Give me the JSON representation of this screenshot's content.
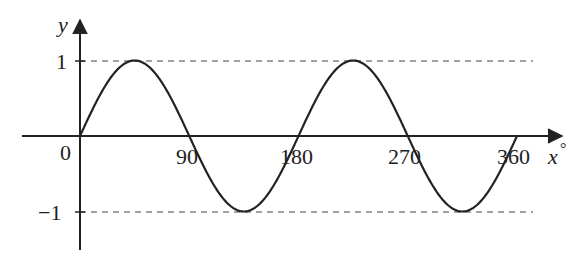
{
  "chart_data": {
    "type": "line",
    "title": "",
    "function": "y = sin(2x)",
    "xlabel": "x°",
    "ylabel": "y",
    "x_ticks": [
      "0",
      "90",
      "180",
      "270",
      "360"
    ],
    "y_ticks": [
      "1",
      "−1"
    ],
    "xlim": [
      0,
      360
    ],
    "ylim": [
      -1,
      1
    ],
    "reference_lines": [
      {
        "y": 1,
        "style": "dashed"
      },
      {
        "y": -1,
        "style": "dashed"
      }
    ],
    "series": [
      {
        "name": "sin 2x",
        "x": [
          0,
          45,
          90,
          135,
          180,
          225,
          270,
          315,
          360
        ],
        "values": [
          0,
          1,
          0,
          -1,
          0,
          1,
          0,
          -1,
          0
        ]
      }
    ],
    "grid": false,
    "legend": null
  },
  "labels": {
    "y_axis": "y",
    "x_axis": "x",
    "degree": "°",
    "origin": "0",
    "x90": "90",
    "x180": "180",
    "x270": "270",
    "x360": "360",
    "y_pos1": "1",
    "y_neg1": "−1"
  }
}
